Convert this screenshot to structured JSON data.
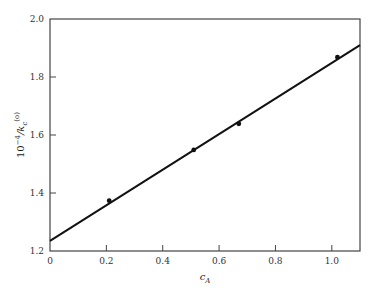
{
  "chart_data": {
    "type": "scatter",
    "title": "",
    "xlabel": "c_A",
    "ylabel": "10^-4/k_c^(o)",
    "xlim": [
      0,
      1.1
    ],
    "ylim": [
      1.2,
      2.0
    ],
    "xticks": [
      0,
      0.2,
      0.4,
      0.6,
      0.8,
      1.0
    ],
    "xtick_labels": [
      "0",
      "0.2",
      "0.4",
      "0.6",
      "0.8",
      "1.0"
    ],
    "yticks": [
      1.2,
      1.4,
      1.6,
      1.8,
      2.0
    ],
    "ytick_labels": [
      "1.2",
      "1.4",
      "1.6",
      "1.8",
      "2.0"
    ],
    "grid": false,
    "legend": null,
    "series": [
      {
        "name": "measured",
        "kind": "points",
        "x": [
          0.21,
          0.51,
          0.67,
          1.02
        ],
        "y": [
          1.37,
          1.545,
          1.635,
          1.865
        ]
      },
      {
        "name": "linear fit",
        "kind": "line",
        "x": [
          0,
          1.1
        ],
        "y": [
          1.235,
          1.91
        ]
      }
    ]
  },
  "labels": {
    "xlabel_main": "c",
    "xlabel_sub": "A",
    "ylabel_prefix": "10",
    "ylabel_exp": "−4",
    "ylabel_rest": "/k",
    "ylabel_sub": "c",
    "ylabel_sup": "(o)"
  }
}
